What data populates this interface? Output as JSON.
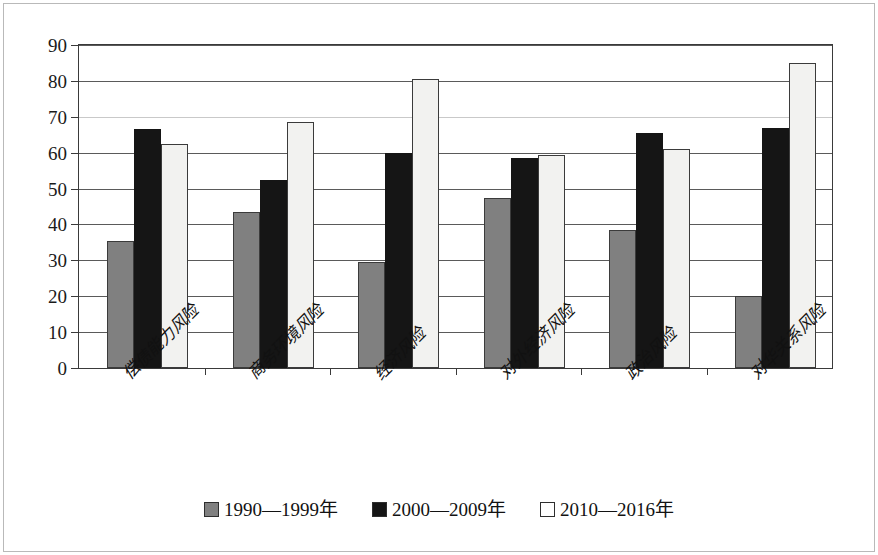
{
  "chart_data": {
    "type": "bar",
    "title": "",
    "xlabel": "",
    "ylabel": "",
    "ylim": [
      0,
      90
    ],
    "yticks": [
      0,
      10,
      20,
      30,
      40,
      50,
      60,
      70,
      80,
      90
    ],
    "ytick_labels": [
      "0",
      "10",
      "20",
      "30",
      "40",
      "50",
      "60",
      "70",
      "80",
      "90"
    ],
    "grid": true,
    "grid_axis": "y",
    "legend_position": "bottom-center",
    "categories": [
      "偿债能力风险",
      "商务环境风险",
      "经济风险",
      "对外经济风险",
      "政治风险",
      "对华关系风险"
    ],
    "series": [
      {
        "name": "1990—1999年",
        "color": "#808080",
        "values": [
          35.5,
          43.5,
          29.5,
          47.5,
          38.5,
          20.0
        ]
      },
      {
        "name": "2000—2009年",
        "color": "#151515",
        "values": [
          66.5,
          52.5,
          60.0,
          58.5,
          65.5,
          67.0
        ]
      },
      {
        "name": "2010—2016年",
        "color": "#f2f2f0",
        "values": [
          62.5,
          68.5,
          80.5,
          59.3,
          61.0,
          85.0
        ]
      }
    ]
  },
  "legend": {
    "items": [
      {
        "label": "1990—1999年",
        "swatch": "gray-swatch"
      },
      {
        "label": "2000—2009年",
        "swatch": "black-swatch"
      },
      {
        "label": "2010—2016年",
        "swatch": "white-swatch"
      }
    ]
  }
}
